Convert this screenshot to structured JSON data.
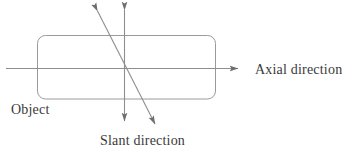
{
  "figure": {
    "type": "schematic-diagram",
    "background_color": "#ffffff",
    "line_color": "#8e8e8e",
    "text_color": "#3a3a3a",
    "width": 357,
    "height": 153
  },
  "labels": {
    "axial": "Axial direction",
    "object": "Object",
    "slant": "Slant direction"
  },
  "shapes": {
    "object_rect": {
      "name": "rounded-rectangle",
      "x": 37,
      "y": 35,
      "width": 179,
      "height": 64,
      "corner_radius": 8
    },
    "axial_axis": {
      "name": "horizontal-arrow",
      "x1": 6,
      "y1": 68,
      "x2": 240,
      "y2": 68,
      "arrowheads": "end"
    },
    "vertical_axis": {
      "name": "vertical-double-arrow",
      "x1": 124,
      "y1": 7,
      "x2": 124,
      "y2": 124,
      "arrowheads": "both"
    },
    "slant_axis": {
      "name": "slant-double-arrow",
      "x1": 95,
      "y1": 7,
      "x2": 157,
      "y2": 128,
      "arrowheads": "both"
    },
    "intersection": {
      "x": 124,
      "y": 68
    }
  }
}
